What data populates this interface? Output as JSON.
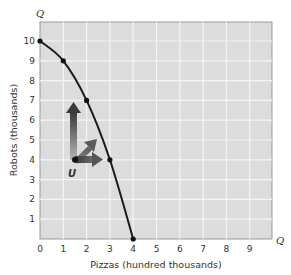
{
  "chart_data": {
    "type": "line",
    "title": "",
    "xlabel": "Pizzas (hundred thousands)",
    "ylabel": "Robots (thousands)",
    "x_axis_end_label": "Q",
    "y_axis_end_label": "Q",
    "xlim": [
      0,
      10
    ],
    "ylim": [
      0,
      11
    ],
    "x_ticks": [
      "0",
      "1",
      "2",
      "3",
      "4",
      "5",
      "6",
      "7",
      "8",
      "9"
    ],
    "y_ticks": [
      "1",
      "2",
      "3",
      "4",
      "5",
      "6",
      "7",
      "8",
      "9",
      "10"
    ],
    "grid": true,
    "series": [
      {
        "name": "Production possibilities frontier",
        "x": [
          0,
          1,
          2,
          3,
          4
        ],
        "y": [
          10,
          9,
          7,
          4,
          0
        ],
        "markers": true
      }
    ],
    "annotations": [
      {
        "label": "U",
        "x": 1.5,
        "y": 4,
        "type": "point"
      },
      {
        "type": "arrow",
        "from": [
          1.5,
          4
        ],
        "direction": "up",
        "to": [
          1.5,
          7
        ]
      },
      {
        "type": "arrow",
        "from": [
          1.5,
          4
        ],
        "direction": "up-right",
        "to": [
          2.4,
          5.2
        ]
      },
      {
        "type": "arrow",
        "from": [
          1.5,
          4
        ],
        "direction": "right",
        "to": [
          2.9,
          4
        ]
      }
    ]
  },
  "labels": {
    "xlabel": "Pizzas (hundred thousands)",
    "ylabel": "Robots (thousands)",
    "q_top": "Q",
    "q_right": "Q",
    "point_u": "U",
    "x_ticks": [
      "0",
      "1",
      "2",
      "3",
      "4",
      "5",
      "6",
      "7",
      "8",
      "9"
    ],
    "y_ticks": [
      "1",
      "2",
      "3",
      "4",
      "5",
      "6",
      "7",
      "8",
      "9",
      "10"
    ]
  },
  "colors": {
    "plot_bg": "#dcdcdc",
    "grid": "#f4f4f4",
    "curve": "#1a1a1a",
    "arrow_dark": "#3a3a3a",
    "arrow_light": "#8a8a8a"
  }
}
